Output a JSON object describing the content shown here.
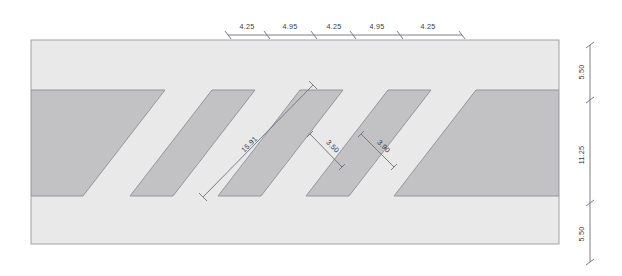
{
  "drawing": {
    "title": "Hatched band section with dimensions",
    "colors": {
      "page_background": "#ffffff",
      "band_fill": "#e9e9ea",
      "hatch_fill": "#c2c2c4",
      "band_outline": "#9a9aa2",
      "hatch_outline": "#8d8d96",
      "dimension_line": "#6f6f79",
      "dimension_text": "#3a3a44"
    },
    "top_dimensions": {
      "label": "top-dimension-chain",
      "segments": [
        {
          "value": "4.25"
        },
        {
          "value": "4.95"
        },
        {
          "value": "4.25"
        },
        {
          "value": "4.95"
        },
        {
          "value": "4.25"
        }
      ]
    },
    "right_dimensions": {
      "label": "right-dimension-chain",
      "segments": [
        {
          "value": "5.50"
        },
        {
          "value": "11.25"
        },
        {
          "value": "5.50"
        }
      ]
    },
    "diagonal_dimensions": [
      {
        "name": "long-diagonal",
        "value": "15.91"
      },
      {
        "name": "gap-width",
        "value": "3.50"
      },
      {
        "name": "stripe-width",
        "value": "3.90"
      }
    ]
  }
}
